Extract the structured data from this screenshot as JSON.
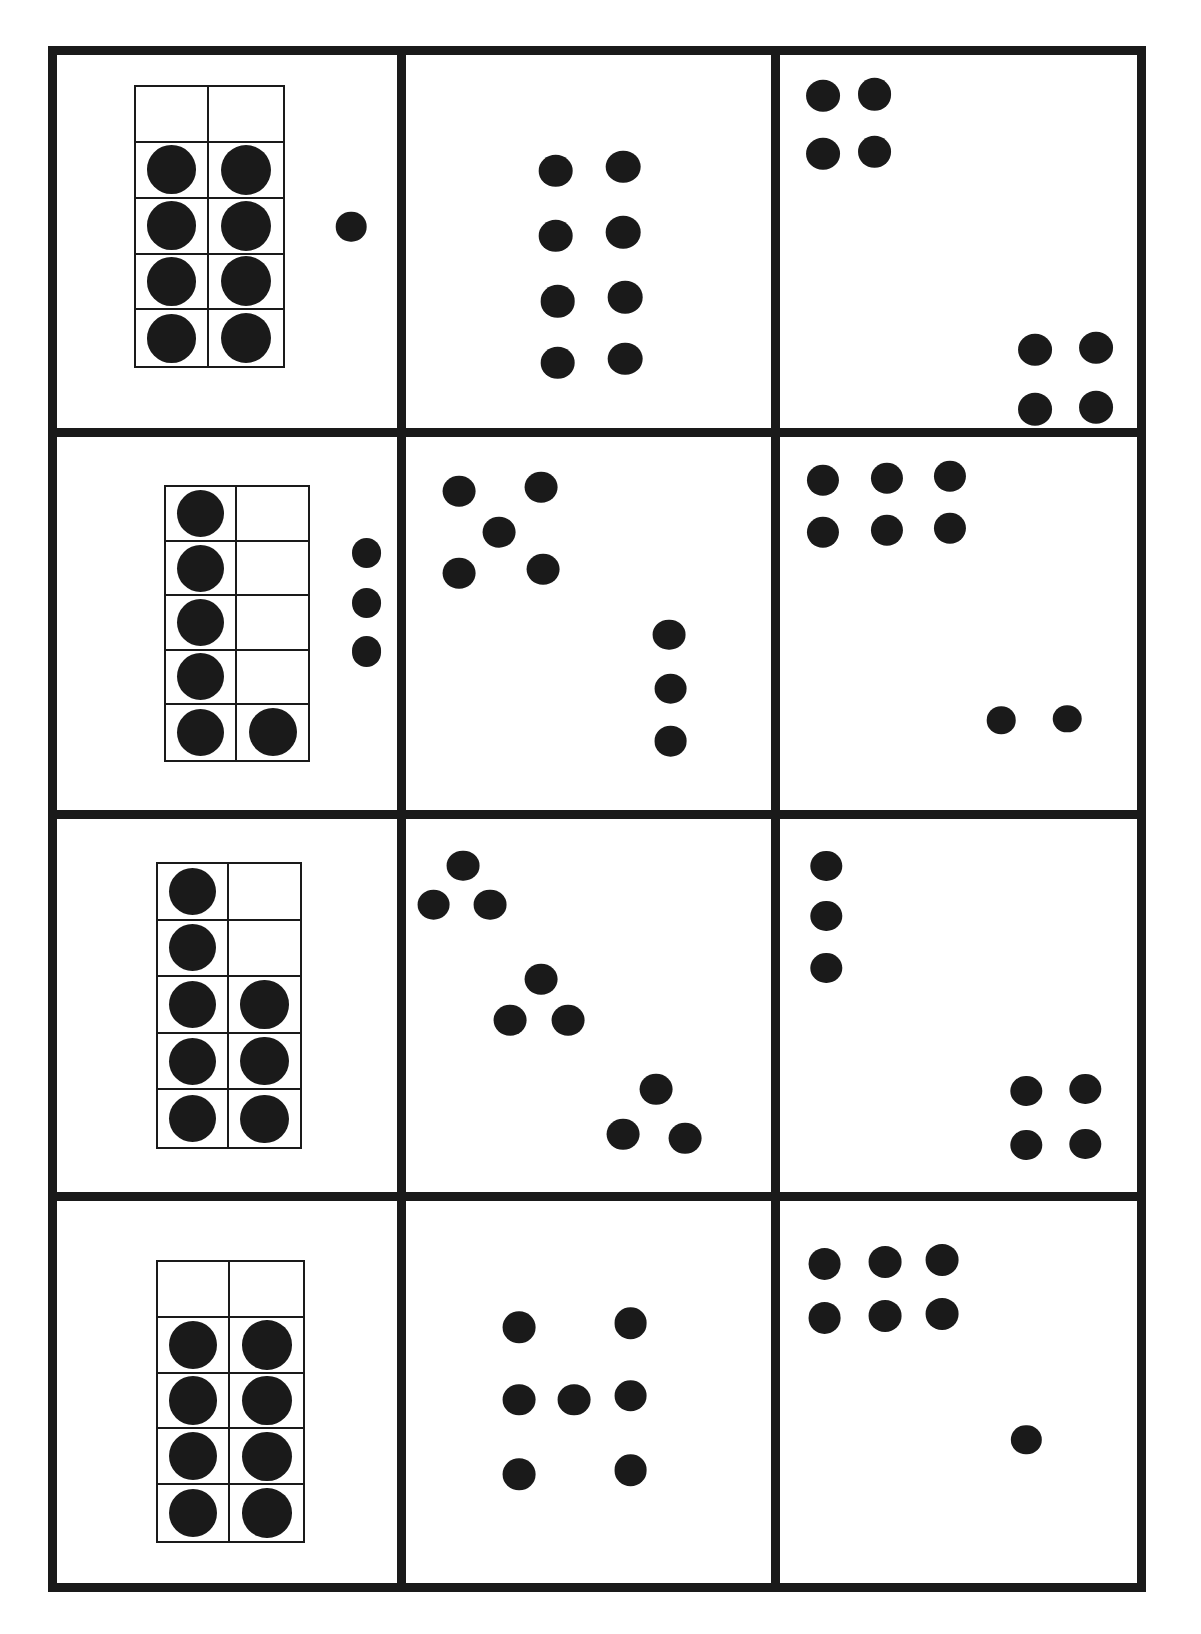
{
  "worksheet": {
    "title": "Dot pattern and ten-frame number representation worksheet",
    "dot_color": "#1a1a1a",
    "background_color": "#ffffff",
    "border_color": "#1a1a1a",
    "grid": {
      "rows": 4,
      "columns": 3
    }
  },
  "cells": [
    {
      "id": "r1c1",
      "row": 1,
      "column": 1,
      "kind": "ten-frame-with-loose-dots",
      "total_dots": 9,
      "ten_frame": {
        "columns": 2,
        "rows": 5,
        "filled_count": 8,
        "filled": [
          [
            false,
            false
          ],
          [
            true,
            true
          ],
          [
            true,
            true
          ],
          [
            true,
            true
          ],
          [
            true,
            true
          ]
        ],
        "box": {
          "left_pct": 22.5,
          "top_pct": 8.0,
          "width_pct": 44.5,
          "height_pct": 76.0
        }
      },
      "loose_dots": [
        {
          "x_pct": 86.5,
          "y_pct": 46.0,
          "size_pct": 9.0
        }
      ]
    },
    {
      "id": "r1c2",
      "row": 1,
      "column": 2,
      "kind": "scattered-dots",
      "total_dots": 8,
      "groups": [
        {
          "name": "centered-2x4-array",
          "count": 8
        }
      ],
      "dots": [
        {
          "x_pct": 41.0,
          "y_pct": 31.0,
          "size_pct": 9.5
        },
        {
          "x_pct": 59.5,
          "y_pct": 30.0,
          "size_pct": 9.5
        },
        {
          "x_pct": 41.0,
          "y_pct": 48.5,
          "size_pct": 9.5
        },
        {
          "x_pct": 59.5,
          "y_pct": 47.5,
          "size_pct": 9.5
        },
        {
          "x_pct": 41.5,
          "y_pct": 66.0,
          "size_pct": 9.5
        },
        {
          "x_pct": 60.0,
          "y_pct": 65.0,
          "size_pct": 9.5
        },
        {
          "x_pct": 41.5,
          "y_pct": 82.5,
          "size_pct": 9.5
        },
        {
          "x_pct": 60.0,
          "y_pct": 81.5,
          "size_pct": 9.5
        }
      ]
    },
    {
      "id": "r1c3",
      "row": 1,
      "column": 3,
      "kind": "scattered-dots",
      "total_dots": 8,
      "groups": [
        {
          "name": "top-left-2x2-cluster",
          "count": 4
        },
        {
          "name": "bottom-right-2x2-cluster",
          "count": 4
        }
      ],
      "dots": [
        {
          "x_pct": 12.0,
          "y_pct": 11.0,
          "size_pct": 9.5
        },
        {
          "x_pct": 26.5,
          "y_pct": 10.5,
          "size_pct": 9.5
        },
        {
          "x_pct": 12.0,
          "y_pct": 26.5,
          "size_pct": 9.5
        },
        {
          "x_pct": 26.5,
          "y_pct": 26.0,
          "size_pct": 9.5
        },
        {
          "x_pct": 71.5,
          "y_pct": 79.0,
          "size_pct": 9.5
        },
        {
          "x_pct": 88.5,
          "y_pct": 78.5,
          "size_pct": 9.5
        },
        {
          "x_pct": 71.5,
          "y_pct": 95.0,
          "size_pct": 9.5
        },
        {
          "x_pct": 88.5,
          "y_pct": 94.5,
          "size_pct": 9.5
        }
      ]
    },
    {
      "id": "r2c1",
      "row": 2,
      "column": 1,
      "kind": "ten-frame-with-loose-dots",
      "total_dots": 9,
      "ten_frame": {
        "columns": 2,
        "rows": 5,
        "filled_count": 6,
        "filled": [
          [
            true,
            false
          ],
          [
            true,
            false
          ],
          [
            true,
            false
          ],
          [
            true,
            false
          ],
          [
            true,
            true
          ]
        ],
        "box": {
          "left_pct": 31.5,
          "top_pct": 13.0,
          "width_pct": 43.0,
          "height_pct": 74.0
        }
      },
      "loose_dots": [
        {
          "x_pct": 91.0,
          "y_pct": 31.0,
          "size_pct": 8.8
        },
        {
          "x_pct": 91.0,
          "y_pct": 44.5,
          "size_pct": 8.8
        },
        {
          "x_pct": 91.0,
          "y_pct": 57.5,
          "size_pct": 8.8
        }
      ]
    },
    {
      "id": "r2c2",
      "row": 2,
      "column": 2,
      "kind": "scattered-dots",
      "total_dots": 8,
      "groups": [
        {
          "name": "top-left-quincunx",
          "count": 5
        },
        {
          "name": "right-vertical-column",
          "count": 3
        }
      ],
      "dots": [
        {
          "x_pct": 14.5,
          "y_pct": 14.5,
          "size_pct": 9.0
        },
        {
          "x_pct": 37.0,
          "y_pct": 13.5,
          "size_pct": 9.0
        },
        {
          "x_pct": 25.5,
          "y_pct": 25.5,
          "size_pct": 9.0
        },
        {
          "x_pct": 14.5,
          "y_pct": 36.5,
          "size_pct": 9.0
        },
        {
          "x_pct": 37.5,
          "y_pct": 35.5,
          "size_pct": 9.0
        },
        {
          "x_pct": 72.0,
          "y_pct": 53.0,
          "size_pct": 9.0
        },
        {
          "x_pct": 72.5,
          "y_pct": 67.5,
          "size_pct": 9.0
        },
        {
          "x_pct": 72.5,
          "y_pct": 81.5,
          "size_pct": 9.0
        }
      ]
    },
    {
      "id": "r2c3",
      "row": 2,
      "column": 3,
      "kind": "scattered-dots",
      "total_dots": 8,
      "groups": [
        {
          "name": "top-left-3x2-array",
          "count": 6
        },
        {
          "name": "bottom-right-pair",
          "count": 2
        }
      ],
      "dots": [
        {
          "x_pct": 12.0,
          "y_pct": 11.5,
          "size_pct": 9.0
        },
        {
          "x_pct": 30.0,
          "y_pct": 11.0,
          "size_pct": 9.0
        },
        {
          "x_pct": 47.5,
          "y_pct": 10.5,
          "size_pct": 9.0
        },
        {
          "x_pct": 12.0,
          "y_pct": 25.5,
          "size_pct": 9.0
        },
        {
          "x_pct": 30.0,
          "y_pct": 25.0,
          "size_pct": 9.0
        },
        {
          "x_pct": 47.5,
          "y_pct": 24.5,
          "size_pct": 9.0
        },
        {
          "x_pct": 62.0,
          "y_pct": 76.0,
          "size_pct": 8.0
        },
        {
          "x_pct": 80.5,
          "y_pct": 75.5,
          "size_pct": 8.0
        }
      ]
    },
    {
      "id": "r3c1",
      "row": 3,
      "column": 1,
      "kind": "ten-frame",
      "total_dots": 8,
      "ten_frame": {
        "columns": 2,
        "rows": 5,
        "filled_count": 8,
        "filled": [
          [
            true,
            false
          ],
          [
            true,
            false
          ],
          [
            true,
            true
          ],
          [
            true,
            true
          ],
          [
            true,
            true
          ]
        ],
        "box": {
          "left_pct": 29.0,
          "top_pct": 11.5,
          "width_pct": 43.0,
          "height_pct": 77.0
        }
      },
      "loose_dots": []
    },
    {
      "id": "r3c2",
      "row": 3,
      "column": 2,
      "kind": "scattered-dots",
      "total_dots": 9,
      "groups": [
        {
          "name": "top-left-triangle",
          "count": 3
        },
        {
          "name": "middle-triangle",
          "count": 3
        },
        {
          "name": "bottom-right-triangle",
          "count": 3
        }
      ],
      "dots": [
        {
          "x_pct": 15.5,
          "y_pct": 12.5,
          "size_pct": 9.0
        },
        {
          "x_pct": 7.5,
          "y_pct": 23.0,
          "size_pct": 9.0
        },
        {
          "x_pct": 23.0,
          "y_pct": 23.0,
          "size_pct": 9.0
        },
        {
          "x_pct": 37.0,
          "y_pct": 43.0,
          "size_pct": 9.0
        },
        {
          "x_pct": 28.5,
          "y_pct": 54.0,
          "size_pct": 9.0
        },
        {
          "x_pct": 44.5,
          "y_pct": 54.0,
          "size_pct": 9.0
        },
        {
          "x_pct": 68.5,
          "y_pct": 72.5,
          "size_pct": 9.0
        },
        {
          "x_pct": 59.5,
          "y_pct": 84.5,
          "size_pct": 9.0
        },
        {
          "x_pct": 76.5,
          "y_pct": 85.5,
          "size_pct": 9.0
        }
      ]
    },
    {
      "id": "r3c3",
      "row": 3,
      "column": 3,
      "kind": "scattered-dots",
      "total_dots": 7,
      "groups": [
        {
          "name": "top-left-vertical-column",
          "count": 3
        },
        {
          "name": "bottom-right-2x2-cluster",
          "count": 4
        }
      ],
      "dots": [
        {
          "x_pct": 13.0,
          "y_pct": 12.5,
          "size_pct": 8.8
        },
        {
          "x_pct": 13.0,
          "y_pct": 26.0,
          "size_pct": 8.8
        },
        {
          "x_pct": 13.0,
          "y_pct": 40.0,
          "size_pct": 8.8
        },
        {
          "x_pct": 69.0,
          "y_pct": 73.0,
          "size_pct": 8.8
        },
        {
          "x_pct": 85.5,
          "y_pct": 72.5,
          "size_pct": 8.8
        },
        {
          "x_pct": 69.0,
          "y_pct": 87.5,
          "size_pct": 8.8
        },
        {
          "x_pct": 85.5,
          "y_pct": 87.0,
          "size_pct": 8.8
        }
      ]
    },
    {
      "id": "r4c1",
      "row": 4,
      "column": 1,
      "kind": "ten-frame",
      "total_dots": 8,
      "ten_frame": {
        "columns": 2,
        "rows": 5,
        "filled_count": 8,
        "filled": [
          [
            false,
            false
          ],
          [
            true,
            true
          ],
          [
            true,
            true
          ],
          [
            true,
            true
          ],
          [
            true,
            true
          ]
        ],
        "box": {
          "left_pct": 29.0,
          "top_pct": 15.5,
          "width_pct": 44.0,
          "height_pct": 74.0
        }
      },
      "loose_dots": []
    },
    {
      "id": "r4c2",
      "row": 4,
      "column": 2,
      "kind": "scattered-dots",
      "total_dots": 7,
      "groups": [
        {
          "name": "dice-seven-pattern",
          "count": 7
        }
      ],
      "dots": [
        {
          "x_pct": 31.0,
          "y_pct": 33.0,
          "size_pct": 9.0
        },
        {
          "x_pct": 61.5,
          "y_pct": 32.0,
          "size_pct": 9.0
        },
        {
          "x_pct": 31.0,
          "y_pct": 52.0,
          "size_pct": 9.0
        },
        {
          "x_pct": 46.0,
          "y_pct": 52.0,
          "size_pct": 9.0
        },
        {
          "x_pct": 61.5,
          "y_pct": 51.0,
          "size_pct": 9.0
        },
        {
          "x_pct": 31.0,
          "y_pct": 71.5,
          "size_pct": 9.0
        },
        {
          "x_pct": 61.5,
          "y_pct": 70.5,
          "size_pct": 9.0
        }
      ]
    },
    {
      "id": "r4c3",
      "row": 4,
      "column": 3,
      "kind": "scattered-dots",
      "total_dots": 7,
      "groups": [
        {
          "name": "top-left-3x2-array",
          "count": 6
        },
        {
          "name": "bottom-right-single",
          "count": 1
        }
      ],
      "dots": [
        {
          "x_pct": 12.5,
          "y_pct": 16.5,
          "size_pct": 9.2
        },
        {
          "x_pct": 29.5,
          "y_pct": 16.0,
          "size_pct": 9.2
        },
        {
          "x_pct": 45.5,
          "y_pct": 15.5,
          "size_pct": 9.2
        },
        {
          "x_pct": 12.5,
          "y_pct": 30.5,
          "size_pct": 9.2
        },
        {
          "x_pct": 29.5,
          "y_pct": 30.0,
          "size_pct": 9.2
        },
        {
          "x_pct": 45.5,
          "y_pct": 29.5,
          "size_pct": 9.2
        },
        {
          "x_pct": 69.0,
          "y_pct": 62.5,
          "size_pct": 8.5
        }
      ]
    }
  ]
}
